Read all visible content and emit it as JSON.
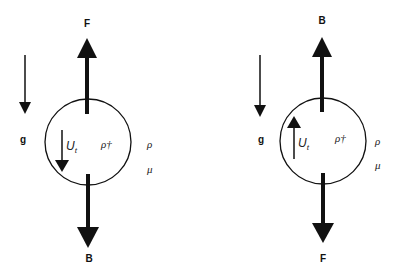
{
  "diagram": {
    "panels": [
      {
        "id": "left",
        "top_force_label": "F",
        "bottom_force_label": "B",
        "gravity_label": "g",
        "velocity_label": "U",
        "velocity_subscript": "t",
        "velocity_direction": "down",
        "particle_density_label": "ρ†",
        "fluid_density_label": "ρ",
        "fluid_viscosity_label": "μ"
      },
      {
        "id": "right",
        "top_force_label": "B",
        "bottom_force_label": "F",
        "gravity_label": "g",
        "velocity_label": "U",
        "velocity_subscript": "t",
        "velocity_direction": "up",
        "particle_density_label": "ρ†",
        "fluid_density_label": "ρ",
        "fluid_viscosity_label": "μ"
      }
    ],
    "colors": {
      "stroke": "#111111",
      "background": "#ffffff"
    }
  }
}
